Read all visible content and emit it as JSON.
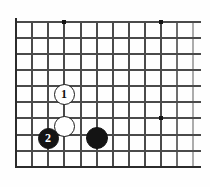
{
  "figure": {
    "kind": "go-board-diagram",
    "background_color": "#fefefe",
    "line_color": "#4a4a4a",
    "border_color": "#2b2b2b",
    "black_color": "#141414",
    "white_color": "#ffffff"
  },
  "board": {
    "left_border_x": 16,
    "top_line_y": 22,
    "bottom_border_y": 167,
    "right_fade_x": 201,
    "grid_step_x": 16.1,
    "grid_step_y": 16.1,
    "columns": 12,
    "rows": 10,
    "vertical_lines_x": [
      16,
      32,
      48,
      64,
      81,
      97,
      113,
      129,
      145,
      161,
      177,
      193
    ],
    "horizontal_lines_y": [
      22,
      38,
      54,
      70,
      86,
      102,
      118,
      135,
      151,
      167
    ],
    "star_points": [
      {
        "name": "star-point-top-left",
        "x": 64,
        "y": 22
      },
      {
        "name": "star-point-top-right",
        "x": 161,
        "y": 22
      },
      {
        "name": "star-point-right",
        "x": 161,
        "y": 118
      }
    ],
    "star_radius": 2.3
  },
  "stones": [
    {
      "name": "white-stone-move-1",
      "color": "white",
      "label": "1",
      "x": 64,
      "y": 94,
      "radius": 10.5
    },
    {
      "name": "white-stone-plain",
      "color": "white",
      "label": "",
      "x": 64,
      "y": 126,
      "radius": 10.5
    },
    {
      "name": "black-stone-move-2",
      "color": "black",
      "label": "2",
      "x": 48,
      "y": 138,
      "radius": 10.5
    },
    {
      "name": "black-stone-plain",
      "color": "black",
      "label": "",
      "x": 97,
      "y": 138,
      "radius": 11
    }
  ]
}
